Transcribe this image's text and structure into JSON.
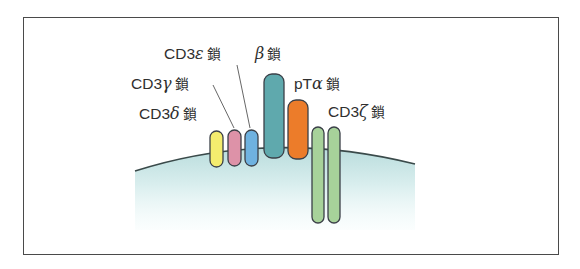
{
  "figure": {
    "labels": {
      "cd3_epsilon": {
        "prefix": "CD3",
        "greek": "ε",
        "suffix": "鎖"
      },
      "beta": {
        "prefix": "",
        "greek": "β",
        "suffix": "鎖"
      },
      "cd3_gamma": {
        "prefix": "CD3",
        "greek": "γ",
        "suffix": "鎖"
      },
      "pt_alpha": {
        "prefix": "pT",
        "greek": "α",
        "suffix": "鎖"
      },
      "cd3_delta": {
        "prefix": "CD3",
        "greek": "δ",
        "suffix": "鎖"
      },
      "cd3_zeta": {
        "prefix": "CD3",
        "greek": "ζ",
        "suffix": "鎖"
      }
    },
    "colors": {
      "frame": "#4a4a4a",
      "membrane_line": "#3a4a4a",
      "cell_fill_top": "#b9dcdc",
      "cell_fill_bottom": "#f2fbfb",
      "cd3_delta": "#f4ec6e",
      "cd3_gamma": "#dd92a8",
      "cd3_epsilon": "#6fb2e0",
      "beta": "#5fa9ad",
      "pt_alpha": "#ec7c2a",
      "cd3_zeta": "#a7d29a",
      "outline": "#3b4048"
    }
  }
}
